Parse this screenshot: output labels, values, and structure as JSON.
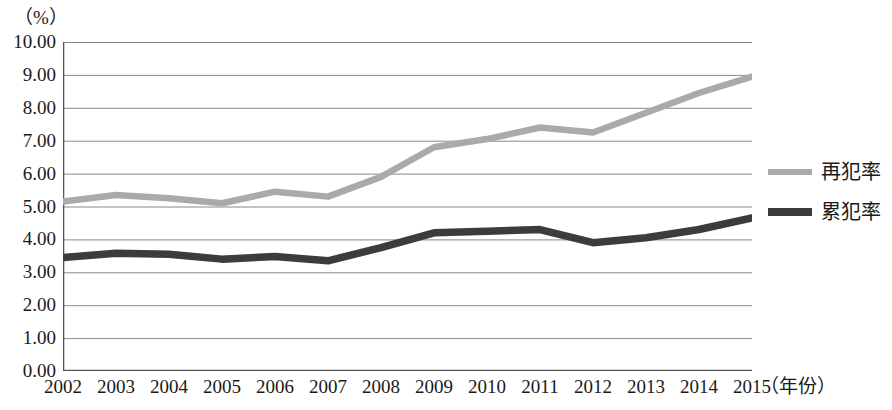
{
  "chart_data": {
    "type": "line",
    "title": "",
    "xlabel": "（年份）",
    "ylabel": "（%）",
    "categories": [
      "2002",
      "2003",
      "2004",
      "2005",
      "2006",
      "2007",
      "2008",
      "2009",
      "2010",
      "2011",
      "2012",
      "2013",
      "2014",
      "2015"
    ],
    "x": [
      2002,
      2003,
      2004,
      2005,
      2006,
      2007,
      2008,
      2009,
      2010,
      2011,
      2012,
      2013,
      2014,
      2015
    ],
    "ylim": [
      0,
      10
    ],
    "ytick_labels": [
      "10.00",
      "9.00",
      "8.00",
      "7.00",
      "6.00",
      "5.00",
      "4.00",
      "3.00",
      "2.00",
      "1.00",
      "0.00"
    ],
    "ytick_values": [
      10,
      9,
      8,
      7,
      6,
      5,
      4,
      3,
      2,
      1,
      0
    ],
    "grid": true,
    "legend_position": "right",
    "series": [
      {
        "name": "再犯率",
        "color": "#aaaaaa",
        "values": [
          5.15,
          5.35,
          5.25,
          5.1,
          5.45,
          5.3,
          5.9,
          6.8,
          7.05,
          7.4,
          7.25,
          7.85,
          8.45,
          8.95
        ]
      },
      {
        "name": "累犯率",
        "color": "#3c3c3c",
        "values": [
          3.45,
          3.58,
          3.55,
          3.4,
          3.48,
          3.35,
          3.75,
          4.2,
          4.25,
          4.3,
          3.9,
          4.05,
          4.3,
          4.65
        ]
      }
    ]
  },
  "legend": {
    "entries": [
      {
        "label": "再犯率"
      },
      {
        "label": "累犯率"
      }
    ]
  },
  "axes": {
    "y_caption": "（%）",
    "x_caption": "（年份）"
  }
}
